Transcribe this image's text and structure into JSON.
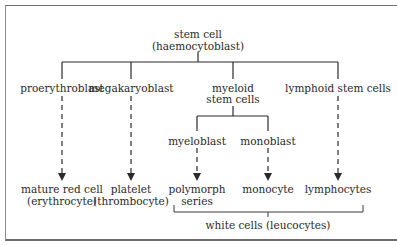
{
  "diagram": {
    "root": {
      "line1": "stem cell",
      "line2": "(haemocytoblast)"
    },
    "branches": [
      {
        "label": "proerythroblast",
        "product_line1": "mature red cell",
        "product_line2": "(erythrocyte)"
      },
      {
        "label": "megakaryoblast",
        "product_line1": "platelet",
        "product_line2": "(thrombocyte)"
      },
      {
        "label_line1": "myeloid",
        "label_line2": "stem cells",
        "children": [
          {
            "label": "myeloblast",
            "product_line1": "polymorph",
            "product_line2": "series"
          },
          {
            "label": "monoblast",
            "product_line1": "monocyte"
          }
        ]
      },
      {
        "label": "lymphoid stem cells",
        "product_line1": "lymphocytes"
      }
    ],
    "group_bracket": {
      "label": "white cells (leucocytes)"
    }
  },
  "colors": {
    "line": "#2a2a2a",
    "text": "#2a2a2a",
    "frame": "#707070",
    "background": "#ffffff"
  }
}
